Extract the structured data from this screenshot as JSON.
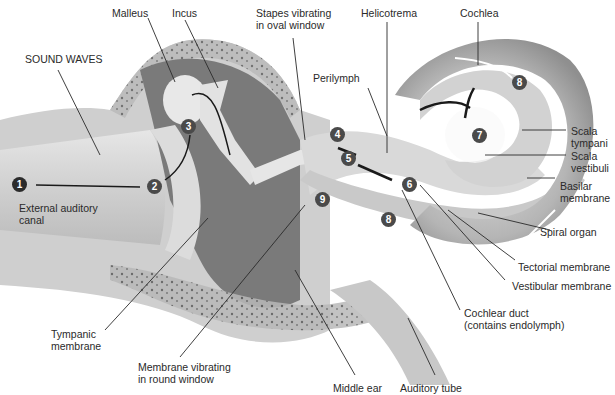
{
  "diagram": {
    "colors": {
      "background": "#ffffff",
      "tissue": "#bdbdbd",
      "bone": "#9e9e9e",
      "cavity": "#6f6f6f",
      "badge": "#4a4a4a",
      "badge_first": "#2b2b2b",
      "leader_line": "#2a2a2a",
      "text": "#2a2a2a"
    },
    "labels": {
      "sound_waves": "SOUND WAVES",
      "malleus": "Malleus",
      "incus": "Incus",
      "stapes_1": "Stapes vibrating",
      "stapes_2": "in oval window",
      "helicotrema": "Helicotrema",
      "cochlea": "Cochlea",
      "perilymph": "Perilymph",
      "scala_tympani_1": "Scala",
      "scala_tympani_2": "tympani",
      "scala_vestibuli_1": "Scala",
      "scala_vestibuli_2": "vestibuli",
      "basilar_1": "Basilar",
      "basilar_2": "membrane",
      "spiral_organ": "Spiral organ",
      "tectorial": "Tectorial membrane",
      "vestibular": "Vestibular membrane",
      "cochlear_duct_1": "Cochlear duct",
      "cochlear_duct_2": "(contains endolymph)",
      "external_canal_1": "External auditory",
      "external_canal_2": "canal",
      "tympanic_1": "Tympanic",
      "tympanic_2": "membrane",
      "round_window_1": "Membrane vibrating",
      "round_window_2": "in round window",
      "middle_ear": "Middle ear",
      "auditory_tube": "Auditory tube"
    },
    "steps": [
      {
        "n": "1",
        "x": 12,
        "y": 177
      },
      {
        "n": "2",
        "x": 147,
        "y": 179
      },
      {
        "n": "3",
        "x": 181,
        "y": 119
      },
      {
        "n": "4",
        "x": 330,
        "y": 127
      },
      {
        "n": "5",
        "x": 341,
        "y": 151
      },
      {
        "n": "6",
        "x": 402,
        "y": 177
      },
      {
        "n": "7",
        "x": 472,
        "y": 128
      },
      {
        "n": "8a",
        "label": "8",
        "x": 512,
        "y": 75
      },
      {
        "n": "8b",
        "label": "8",
        "x": 381,
        "y": 212
      },
      {
        "n": "9",
        "x": 315,
        "y": 192
      }
    ]
  }
}
